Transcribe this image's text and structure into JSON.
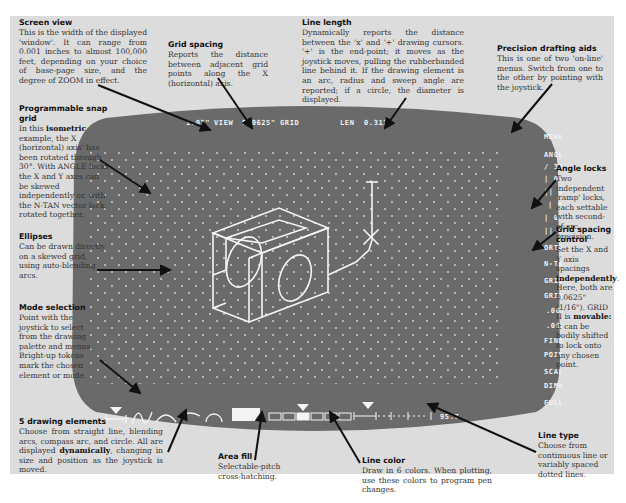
{
  "annotations": {
    "screen_view": {
      "title": "Screen view",
      "body": "This is the width of the displayed 'window'. It can range from 0.001 inches to almost 100,000 feet, depending on your choice of base-page size, and the degree of ZOOM in effect."
    },
    "grid_spacing": {
      "title": "Grid spacing",
      "body": "Reports the distance between adjacent grid points along the X (horizontal) axis."
    },
    "line_length": {
      "title": "Line length",
      "body": "Dynamically reports the distance between the 'x' and '+' drawing cursors. '+' is the end-point; it moves as the joystick moves, pulling the rubberbanded line behind it. If the drawing element is an arc, radius and sweep angle are reported; if a circle, the diameter is displayed."
    },
    "precision_aids": {
      "title": "Precision drafting aids",
      "body": "This is one of two 'on-line' menus. Switch from one to the other by pointing with the joystick."
    },
    "snap_grid": {
      "title": "Programmable snap grid",
      "body_pre": "In this ",
      "body_bold": "isometric",
      "body_post": " example, the X (horizontal) axis' has been rotated through 30°. With ANGLE locks the X and Y axes can be skewed independently or, with the N-TAN vector lock, rotated together."
    },
    "angle_locks": {
      "title": "Angle locks",
      "body": "Two independent 'ramp' locks, each settable with second-of-arc precision."
    },
    "ellipses": {
      "title": "Ellipses",
      "body": "Can be drawn directly on a skewed grid, using auto-blending arcs."
    },
    "grid_spacing_control": {
      "title": "Grid spacing control",
      "body_pre": "Set the X and Y axis spacings ",
      "body_bold": "independently",
      "body_mid": ". Here, both are 0.0625\" (1/16\"). GRID II is ",
      "body_bold2": "movable:",
      "body_post": " it can be bodily shifted to lock onto any chosen point."
    },
    "mode_selection": {
      "title": "Mode selection",
      "body": "Point with the joystick to select from the drawing palette and menus. Bright-up tokens mark the chosen element or mode."
    },
    "drawing_elements": {
      "title": "5 drawing elements",
      "body_pre": "Choose from straight line, blending arcs, compass arc, and circle. All are displayed ",
      "body_bold": "dynamically",
      "body_post": ", changing in size and position as the joystick is moved."
    },
    "area_fill": {
      "title": "Area fill",
      "body": "Selectable-pitch cross-hatching."
    },
    "line_color": {
      "title": "Line color",
      "body": "Draw in 6 colors. When plotting, use these colors to program pen changes."
    },
    "line_type": {
      "title": "Line type",
      "body": "Choose from continuous line or variably spaced dotted lines."
    }
  },
  "screen": {
    "status_bar": {
      "view_value": "1.03\"",
      "view_label": "VIEW",
      "grid_value": "0.0625\"",
      "grid_label": "GRID",
      "len_label": "LEN",
      "len_value": "0.313\""
    },
    "menu": [
      "MENU",
      "ANGLE",
      "/ 30",
      "| 0",
      "|| 0",
      "| 90",
      "| 0",
      "|| 0",
      "ORTH",
      "N-TAN",
      "GRID I",
      "GRID II",
      ".0625",
      ".0625",
      "FIND",
      "POINT",
      "SCALE",
      "DIMN",
      "FULL"
    ],
    "line_type_value": "95.7",
    "palette": {
      "elements": [
        "straight-line",
        "blending-arcs",
        "compass-arc",
        "arc",
        "circle"
      ],
      "selected_element": "straight-line",
      "fill": "area-fill",
      "colors_count": 6,
      "selected_color": 3,
      "line_type_selected": "continuous"
    },
    "colors": {
      "screen_bg": "#6b6b6b",
      "phosphor": "#f4f4f4",
      "page_bg": "#dcdcdc"
    }
  }
}
